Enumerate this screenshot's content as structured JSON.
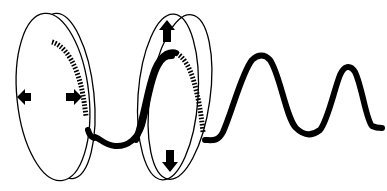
{
  "diagram": {
    "title": "",
    "colors": {
      "stroke": "#000000",
      "background": "#ffffff"
    },
    "filters": [
      {
        "name": "first-polarizer",
        "arrows": [
          "left",
          "right"
        ],
        "orientation": "horizontal"
      },
      {
        "name": "second-polarizer",
        "arrows": [
          "up",
          "down"
        ],
        "orientation": "vertical"
      }
    ],
    "wave": {
      "peaks_visible": 3
    }
  }
}
